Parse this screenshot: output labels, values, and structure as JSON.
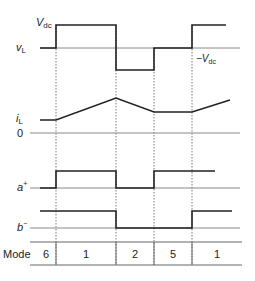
{
  "diagram": {
    "signals": {
      "vL": {
        "label": "v",
        "sub": "L",
        "high_label_main": "V",
        "high_label_sub": "dc",
        "low_label_prefix": "−V",
        "low_label_sub": "dc"
      },
      "iL": {
        "label": "i",
        "sub": "L",
        "zero_label": "0"
      },
      "a_plus": {
        "label": "a",
        "sup": "+"
      },
      "b_minus": {
        "label": "b",
        "sup": "−"
      }
    },
    "mode_row": {
      "header": "Mode",
      "cells": [
        "6",
        "1",
        "2",
        "5",
        "1"
      ]
    },
    "transitions_x": [
      56,
      116,
      154,
      192
    ],
    "colors": {
      "waveform": "#222222",
      "axis": "#8a8a8a",
      "guide": "#555555"
    }
  }
}
